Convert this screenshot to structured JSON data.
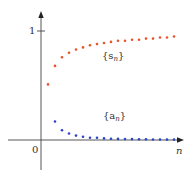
{
  "chart_data": {
    "type": "scatter",
    "title": "",
    "xlabel": "n",
    "ylabel": "",
    "x_axis_origin_label": "0",
    "y_ticks": [
      {
        "value": 1,
        "label": "1"
      }
    ],
    "xlim": [
      0,
      20
    ],
    "ylim": [
      -0.3,
      1.1
    ],
    "grid": false,
    "legend": "inline labels",
    "series": [
      {
        "name": "{s_n}",
        "label_text": "{s",
        "label_sub": "n",
        "label_close": "}",
        "color": "#e8542c",
        "x": [
          1,
          2,
          3,
          4,
          5,
          6,
          7,
          8,
          9,
          10,
          11,
          12,
          13,
          14,
          15,
          16,
          17,
          18,
          19
        ],
        "values": [
          0.51,
          0.68,
          0.76,
          0.8,
          0.83,
          0.85,
          0.87,
          0.88,
          0.89,
          0.9,
          0.91,
          0.91,
          0.92,
          0.92,
          0.93,
          0.93,
          0.94,
          0.94,
          0.95
        ]
      },
      {
        "name": "{a_n}",
        "label_text": "{a",
        "label_sub": "n",
        "label_close": "}",
        "color": "#2b45c8",
        "x": [
          2,
          3,
          4,
          5,
          6,
          7,
          8,
          9,
          10,
          11,
          12,
          13,
          14,
          15,
          16,
          17,
          18,
          19
        ],
        "values": [
          0.17,
          0.09,
          0.06,
          0.04,
          0.03,
          0.02,
          0.02,
          0.015,
          0.012,
          0.01,
          0.009,
          0.008,
          0.007,
          0.006,
          0.005,
          0.005,
          0.004,
          0.004
        ]
      }
    ]
  }
}
